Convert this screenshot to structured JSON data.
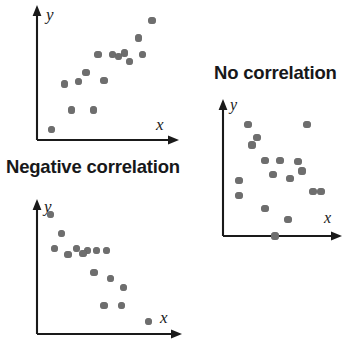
{
  "figure": {
    "background_color": "#ffffff",
    "dot_color": "#6e6e6e",
    "axis_color": "#1a1a1a",
    "title_color": "#17181a",
    "width": 348,
    "height": 350
  },
  "titles": {
    "negative": "Negative correlation",
    "none": "No correlation",
    "positive": ""
  },
  "axis_labels": {
    "x": "x",
    "y": "y"
  },
  "chart_data": [
    {
      "type": "scatter",
      "name": "positive-correlation",
      "title": "",
      "xlabel": "x",
      "ylabel": "y",
      "xlim": [
        0,
        100
      ],
      "ylim": [
        0,
        100
      ],
      "grid": false,
      "legend": false,
      "n_points": 15,
      "points": [
        {
          "x": 6,
          "y": 5
        },
        {
          "x": 23,
          "y": 21
        },
        {
          "x": 41,
          "y": 21
        },
        {
          "x": 17,
          "y": 42
        },
        {
          "x": 35,
          "y": 51
        },
        {
          "x": 50,
          "y": 45
        },
        {
          "x": 45,
          "y": 66
        },
        {
          "x": 57,
          "y": 66
        },
        {
          "x": 67,
          "y": 67
        },
        {
          "x": 71,
          "y": 60
        },
        {
          "x": 82,
          "y": 66
        },
        {
          "x": 79,
          "y": 79
        },
        {
          "x": 90,
          "y": 93
        },
        {
          "x": 62,
          "y": 64
        },
        {
          "x": 29,
          "y": 44
        }
      ]
    },
    {
      "type": "scatter",
      "name": "negative-correlation",
      "title": "Negative correlation",
      "xlabel": "x",
      "ylabel": "y",
      "xlim": [
        0,
        100
      ],
      "ylim": [
        0,
        100
      ],
      "grid": false,
      "legend": false,
      "n_points": 15,
      "points": [
        {
          "x": 7,
          "y": 95
        },
        {
          "x": 16,
          "y": 79
        },
        {
          "x": 10,
          "y": 67
        },
        {
          "x": 21,
          "y": 62
        },
        {
          "x": 28,
          "y": 67
        },
        {
          "x": 37,
          "y": 65
        },
        {
          "x": 44,
          "y": 65
        },
        {
          "x": 52,
          "y": 65
        },
        {
          "x": 42,
          "y": 47
        },
        {
          "x": 55,
          "y": 42
        },
        {
          "x": 66,
          "y": 35
        },
        {
          "x": 50,
          "y": 20
        },
        {
          "x": 64,
          "y": 20
        },
        {
          "x": 86,
          "y": 7
        },
        {
          "x": 33,
          "y": 63
        }
      ]
    },
    {
      "type": "scatter",
      "name": "no-correlation",
      "title": "No correlation",
      "xlabel": "x",
      "ylabel": "y",
      "xlim": [
        0,
        100
      ],
      "ylim": [
        0,
        100
      ],
      "grid": false,
      "legend": false,
      "n_points": 17,
      "points": [
        {
          "x": 20,
          "y": 86
        },
        {
          "x": 29,
          "y": 76
        },
        {
          "x": 79,
          "y": 86
        },
        {
          "x": 37,
          "y": 58
        },
        {
          "x": 52,
          "y": 58
        },
        {
          "x": 70,
          "y": 57
        },
        {
          "x": 45,
          "y": 47
        },
        {
          "x": 11,
          "y": 43
        },
        {
          "x": 62,
          "y": 44
        },
        {
          "x": 11,
          "y": 31
        },
        {
          "x": 85,
          "y": 34
        },
        {
          "x": 93,
          "y": 34
        },
        {
          "x": 37,
          "y": 21
        },
        {
          "x": 60,
          "y": 13
        },
        {
          "x": 47,
          "y": 0
        },
        {
          "x": 24,
          "y": 70
        },
        {
          "x": 74,
          "y": 50
        }
      ]
    }
  ]
}
